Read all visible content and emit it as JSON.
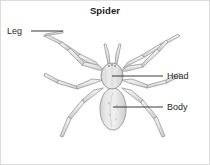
{
  "figure": {
    "title": "Spider",
    "background_color": "#ffffff",
    "width": 210,
    "height": 165,
    "border": {
      "visible": true,
      "color": "#d8d8d8"
    }
  },
  "labels": [
    {
      "id": "leg",
      "text": "Leg",
      "side": "left",
      "leader_line": {
        "color": "#3a3a3a",
        "from_x": 31,
        "from_y": 31,
        "to_x": 63,
        "to_y": 31
      }
    },
    {
      "id": "head",
      "text": "Head",
      "side": "right",
      "leader_line": {
        "color": "#3a3a3a",
        "from_x": 163,
        "from_y": 76,
        "to_x": 112,
        "to_y": 76
      }
    },
    {
      "id": "body",
      "text": "Body",
      "side": "right",
      "leader_line": {
        "color": "#3a3a3a",
        "from_x": 163,
        "from_y": 107,
        "to_x": 113,
        "to_y": 107
      }
    }
  ],
  "illustration": {
    "style": "grayscale line drawing",
    "outline_color": "#8e8e8e",
    "fill_light": "#e9e9e9",
    "fill_mid": "#dcdcdc",
    "fill_shadow": "#cfcfcf",
    "parts": {
      "cephalothorax": {
        "name": "Head",
        "center_x": 112,
        "center_y": 76,
        "rx": 11,
        "ry": 13
      },
      "abdomen": {
        "name": "Body",
        "center_x": 113,
        "center_y": 109,
        "rx": 13,
        "ry": 21
      },
      "legs": {
        "name": "Leg",
        "count": 8,
        "segments_per_leg": 3
      },
      "pedipalps": {
        "count": 2
      }
    }
  }
}
